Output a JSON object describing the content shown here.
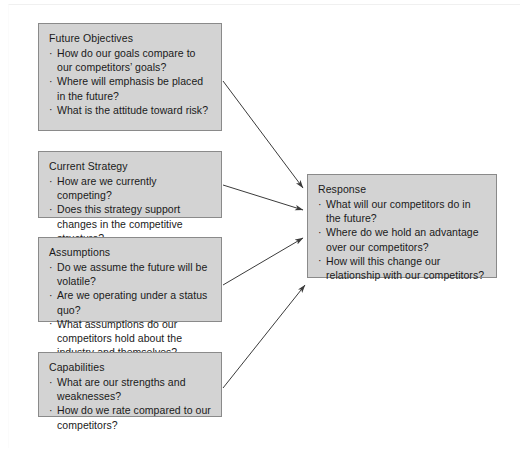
{
  "diagram": {
    "colors": {
      "node_fill": "#d3d3d3",
      "node_border": "#8a8a8a",
      "arrow": "#3b3b3b",
      "text": "#1a1a1a",
      "background": "#ffffff"
    },
    "nodes": [
      {
        "id": "future-objectives",
        "title": "Future Objectives",
        "items": [
          "How do our goals compare to our competitors’ goals?",
          "Where will emphasis be placed in the future?",
          "What is the attitude toward risk?"
        ]
      },
      {
        "id": "current-strategy",
        "title": "Current Strategy",
        "items": [
          "How are we currently competing?",
          "Does this strategy support changes in the competitive structure?"
        ]
      },
      {
        "id": "assumptions",
        "title": "Assumptions",
        "items": [
          "Do we assume the future will be volatile?",
          "Are we operating under a status quo?",
          "What assumptions do our competitors hold about the industry and themselves?"
        ]
      },
      {
        "id": "capabilities",
        "title": "Capabilities",
        "items": [
          "What are our strengths and weaknesses?",
          "How do we rate compared to our competitors?"
        ]
      },
      {
        "id": "response",
        "title": "Response",
        "items": [
          "What will our competitors do in the future?",
          "Where do we hold an advantage over our competitors?",
          "How will this change our relationship with our competitors?"
        ]
      }
    ],
    "bullet": "·",
    "connectors": [
      {
        "id": "arrow-future-objectives-to-response",
        "from": "future-objectives",
        "to": "response"
      },
      {
        "id": "arrow-current-strategy-to-response",
        "from": "current-strategy",
        "to": "response"
      },
      {
        "id": "arrow-assumptions-to-response",
        "from": "assumptions",
        "to": "response"
      },
      {
        "id": "arrow-capabilities-to-response",
        "from": "capabilities",
        "to": "response"
      }
    ]
  }
}
